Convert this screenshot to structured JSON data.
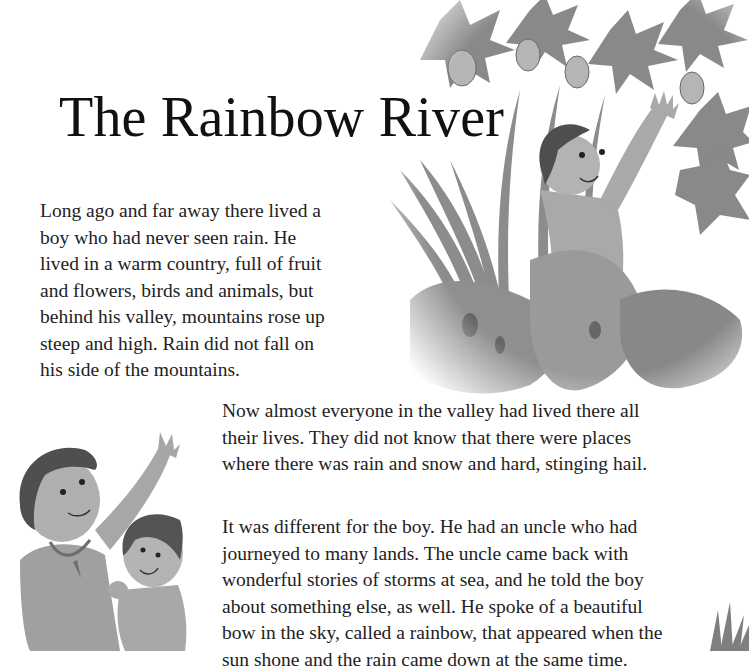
{
  "page": {
    "title": "The Rainbow River",
    "paragraphs": [
      {
        "lines": [
          "Long ago and far away there lived a",
          "boy who had never seen rain. He",
          "lived in a warm country, full of fruit",
          "and flowers, birds and animals, but",
          "behind his valley, mountains rose up",
          "steep and high. Rain did not fall on",
          "his side of the mountains."
        ]
      },
      {
        "lines": [
          "Now almost everyone in the valley had lived there all",
          "their lives. They did not know that there were places",
          "where there was rain and snow and hard, stinging hail."
        ]
      },
      {
        "lines": [
          "It was different for the boy. He had an uncle who had",
          "journeyed to many lands. The uncle came back with",
          "wonderful stories of storms at sea, and he told the boy",
          "about something else, as well. He spoke of a beautiful",
          "bow in the sky, called a rainbow, that appeared when the",
          "sun shone and the rain came down at the same time."
        ]
      }
    ],
    "illustrations": [
      {
        "name": "boy-reaching-for-fruit-illustration",
        "description": "Boy in jungle foliage reaching up toward hanging fruit"
      },
      {
        "name": "uncle-and-boy-pointing-illustration",
        "description": "Uncle with necklace pointing to the sky beside the boy"
      },
      {
        "name": "grass-corner-illustration",
        "description": "Grass tufts at bottom right"
      }
    ],
    "colors": {
      "text": "#222222",
      "title": "#111111",
      "background": "#ffffff",
      "illustration_dark": "#555555",
      "illustration_mid": "#8a8a8a",
      "illustration_light": "#c4c4c4"
    }
  }
}
